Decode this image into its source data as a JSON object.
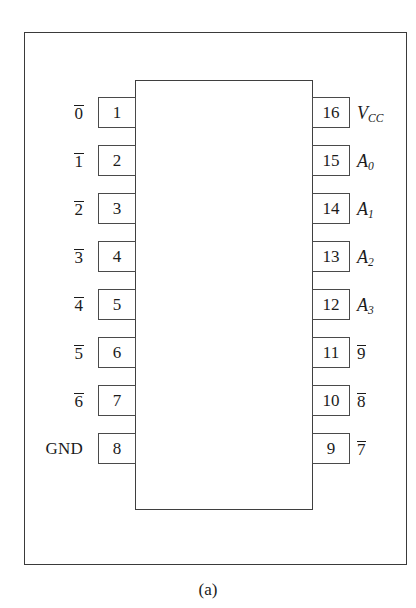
{
  "figure": {
    "caption": "(a)",
    "device_style": "dual-in-line-package-pinout",
    "colors": {
      "ink": "#1b1b1b",
      "line": "#3f3f3f",
      "frame": "#3a3a3a",
      "background": "#ffffff"
    }
  },
  "pins": {
    "left": [
      {
        "number": "1",
        "label": "0",
        "overbar": true,
        "italic": false
      },
      {
        "number": "2",
        "label": "1",
        "overbar": true,
        "italic": false
      },
      {
        "number": "3",
        "label": "2",
        "overbar": true,
        "italic": false
      },
      {
        "number": "4",
        "label": "3",
        "overbar": true,
        "italic": false
      },
      {
        "number": "5",
        "label": "4",
        "overbar": true,
        "italic": false
      },
      {
        "number": "6",
        "label": "5",
        "overbar": true,
        "italic": false
      },
      {
        "number": "7",
        "label": "6",
        "overbar": true,
        "italic": false
      },
      {
        "number": "8",
        "label": "GND",
        "overbar": false,
        "italic": false
      }
    ],
    "right": [
      {
        "number": "16",
        "label": "V",
        "subscript": "CC",
        "overbar": false,
        "italic": true
      },
      {
        "number": "15",
        "label": "A",
        "subscript": "0",
        "overbar": false,
        "italic": true
      },
      {
        "number": "14",
        "label": "A",
        "subscript": "1",
        "overbar": false,
        "italic": true
      },
      {
        "number": "13",
        "label": "A",
        "subscript": "2",
        "overbar": false,
        "italic": true
      },
      {
        "number": "12",
        "label": "A",
        "subscript": "3",
        "overbar": false,
        "italic": true
      },
      {
        "number": "11",
        "label": "9",
        "overbar": true,
        "italic": false
      },
      {
        "number": "10",
        "label": "8",
        "overbar": true,
        "italic": false
      },
      {
        "number": "9",
        "label": "7",
        "overbar": true,
        "italic": false
      }
    ]
  }
}
